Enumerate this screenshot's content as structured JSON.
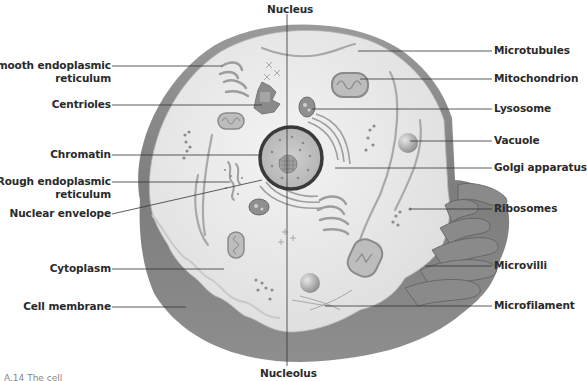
{
  "diagram": {
    "type": "labeled illustration",
    "colors": {
      "background": "#ffffff",
      "cytoplasm": "#ececec",
      "membrane_dark": "#7a7a7a",
      "membrane_light": "#a8a8a8",
      "leader_line": "#333333",
      "label_text": "#2a2a2a",
      "nucleus_fill": "#b9b9b9",
      "nuclear_envelope": "#3a3a3a"
    }
  },
  "labels": {
    "top": {
      "nucleus": "Nucleus"
    },
    "bottom": {
      "nucleolus": "Nucleolus"
    },
    "left": {
      "smooth_er_line1": "Smooth endoplasmic",
      "smooth_er_line2": "reticulum",
      "centrioles": "Centrioles",
      "chromatin": "Chromatin",
      "rough_er_line1": "Rough endoplasmic",
      "rough_er_line2": "reticulum",
      "nuclear_envelope": "Nuclear envelope",
      "cytoplasm": "Cytoplasm",
      "cell_membrane": "Cell membrane"
    },
    "right": {
      "microtubules": "Microtubules",
      "mitochondrion": "Mitochondrion",
      "lysosome": "Lysosome",
      "vacuole": "Vacuole",
      "golgi": "Golgi apparatus",
      "ribosomes": "Ribosomes",
      "microvilli": "Microvilli",
      "microfilament": "Microfilament"
    }
  },
  "caption": "A.14 The cell"
}
